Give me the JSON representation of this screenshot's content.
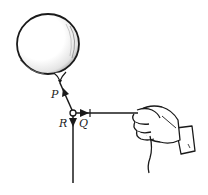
{
  "diagram": {
    "colors": {
      "ink": "#1a1a1a",
      "background": "#ffffff"
    },
    "labels": {
      "P": "P",
      "Q": "Q",
      "R": "R"
    },
    "elements": [
      {
        "id": "balloon",
        "label": ""
      },
      {
        "id": "knot",
        "label": ""
      },
      {
        "id": "string-to-balloon",
        "force_label": "P",
        "direction": "up-left"
      },
      {
        "id": "string-to-hand",
        "force_label": "Q",
        "direction": "right"
      },
      {
        "id": "hanging-string",
        "force_label": "R",
        "direction": "down"
      },
      {
        "id": "hand",
        "label": ""
      }
    ]
  }
}
